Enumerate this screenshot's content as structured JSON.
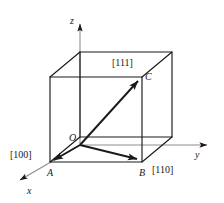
{
  "figure": {
    "type": "crystallographic-unit-cell-directions",
    "stroke_color": "#1a1a1a",
    "background_color": "#ffffff"
  },
  "axes": {
    "z": {
      "label": "z",
      "x": 70,
      "y": 16
    },
    "y": {
      "label": "y",
      "x": 195,
      "y": 150
    },
    "x": {
      "label": "x",
      "x": 27,
      "y": 186
    }
  },
  "points": {
    "origin": {
      "label": "O",
      "x": 69,
      "y": 133
    },
    "a": {
      "label": "A",
      "x": 47,
      "y": 168
    },
    "b": {
      "label": "B",
      "x": 139,
      "y": 168
    },
    "c": {
      "label": "C",
      "x": 145,
      "y": 72
    }
  },
  "indices": {
    "d100": {
      "label": "[100]",
      "x": 10,
      "y": 150
    },
    "d110": {
      "label": "[110]",
      "x": 152,
      "y": 165
    },
    "d111": {
      "label": "[111]",
      "x": 112,
      "y": 58
    }
  },
  "geometry": {
    "cube_front": [
      {
        "name": "front-bottom-left",
        "x": 50,
        "y": 162
      },
      {
        "name": "front-bottom-right",
        "x": 142,
        "y": 162
      },
      {
        "name": "front-top-right",
        "x": 142,
        "y": 77
      },
      {
        "name": "front-top-left",
        "x": 50,
        "y": 77
      }
    ],
    "cube_back": [
      {
        "name": "back-bottom-left",
        "x": 80,
        "y": 137
      },
      {
        "name": "back-bottom-right",
        "x": 172,
        "y": 137
      },
      {
        "name": "back-top-right",
        "x": 172,
        "y": 52
      },
      {
        "name": "back-top-left",
        "x": 80,
        "y": 52
      }
    ],
    "direction_vectors": [
      {
        "name": "[100]",
        "from": "O",
        "to": "A"
      },
      {
        "name": "[110]",
        "from": "O",
        "to": "B"
      },
      {
        "name": "[111]",
        "from": "O",
        "to": "C"
      }
    ]
  }
}
